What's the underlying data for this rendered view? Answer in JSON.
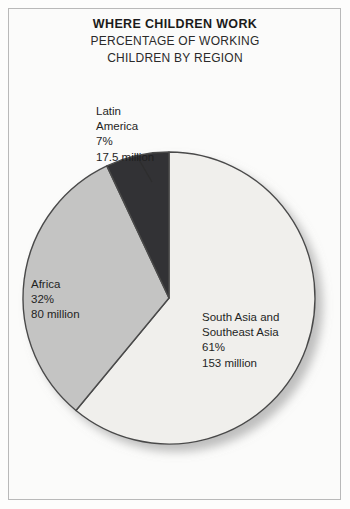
{
  "figure": {
    "title": "WHERE CHILDREN WORK",
    "subtitle_line1": "PERCENTAGE OF WORKING",
    "subtitle_line2": "CHILDREN BY REGION"
  },
  "labels": {
    "latin": {
      "name_line1": "Latin",
      "name_line2": "America",
      "percent": "7%",
      "count": "17.5 million"
    },
    "africa": {
      "name_line1": "Africa",
      "percent": "32%",
      "count": "80 million"
    },
    "southasia": {
      "name_line1": "South Asia and",
      "name_line2": "Southeast Asia",
      "percent": "61%",
      "count": "153 million"
    }
  },
  "colors": {
    "south_asia": "#f0efec",
    "africa": "#c4c4c3",
    "latin_america": "#333334",
    "outline": "#4a4a4a",
    "frame": "#b9b9b9",
    "background": "#fbfbfa",
    "text": "#1f1f1f"
  },
  "chart_data": {
    "type": "pie",
    "title": "WHERE CHILDREN WORK",
    "subtitle": "PERCENTAGE OF WORKING CHILDREN BY REGION",
    "xlabel": "",
    "ylabel": "",
    "legend_position": "none",
    "grid": false,
    "value_unit": "percent",
    "categories": [
      "South Asia and Southeast Asia",
      "Africa",
      "Latin America"
    ],
    "values": [
      61,
      32,
      7
    ],
    "counts_millions": [
      153,
      80,
      17.5
    ],
    "slice_colors": [
      "#f0efec",
      "#c4c4c3",
      "#333334"
    ],
    "start_angle_deg": 0,
    "direction": "clockwise",
    "annotations": [
      "South Asia and Southeast Asia 61% 153 million",
      "Africa 32% 80 million",
      "Latin America 7% 17.5 million"
    ]
  }
}
